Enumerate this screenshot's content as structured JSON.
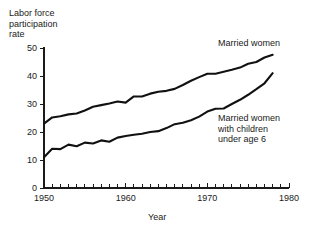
{
  "chart_data": {
    "type": "line",
    "title": "",
    "ylabel": "Labor force\nparticipation\nrate",
    "xlabel": "Year",
    "xlim": [
      1950,
      1980
    ],
    "ylim": [
      0,
      50
    ],
    "ytick_labels": [
      "0",
      "10",
      "20",
      "30",
      "40",
      "50"
    ],
    "ytick_values": [
      0,
      10,
      20,
      30,
      40,
      50
    ],
    "xtick_labels": [
      "1950",
      "1960",
      "1970",
      "1980"
    ],
    "xtick_values": [
      1950,
      1960,
      1970,
      1980
    ],
    "xtick_minor_step": 1,
    "grid": false,
    "legend_position": "inline-annotations",
    "line_color": "#111111",
    "series": [
      {
        "name": "Married women",
        "annotation": "Married women",
        "x": [
          1950,
          1951,
          1952,
          1953,
          1954,
          1955,
          1956,
          1957,
          1958,
          1959,
          1960,
          1961,
          1962,
          1963,
          1964,
          1965,
          1966,
          1967,
          1968,
          1969,
          1970,
          1971,
          1972,
          1973,
          1974,
          1975,
          1976,
          1977,
          1978
        ],
        "values": [
          23.0,
          25.2,
          25.6,
          26.3,
          26.6,
          27.7,
          29.0,
          29.6,
          30.2,
          30.9,
          30.5,
          32.7,
          32.7,
          33.7,
          34.4,
          34.7,
          35.4,
          36.8,
          38.3,
          39.6,
          40.8,
          40.8,
          41.5,
          42.2,
          43.0,
          44.4,
          45.0,
          46.6,
          47.6
        ]
      },
      {
        "name": "Married women with children under age 6",
        "annotation": "Married women\nwith children\nunder age 6",
        "x": [
          1950,
          1951,
          1952,
          1953,
          1954,
          1955,
          1956,
          1957,
          1958,
          1959,
          1960,
          1961,
          1962,
          1963,
          1964,
          1965,
          1966,
          1967,
          1968,
          1969,
          1970,
          1971,
          1972,
          1973,
          1974,
          1975,
          1976,
          1977,
          1978
        ],
        "values": [
          11.0,
          14.0,
          13.9,
          15.5,
          14.9,
          16.2,
          15.9,
          17.0,
          16.5,
          18.0,
          18.6,
          19.0,
          19.4,
          20.0,
          20.3,
          21.4,
          22.8,
          23.3,
          24.2,
          25.5,
          27.3,
          28.3,
          28.4,
          30.0,
          31.5,
          33.3,
          35.3,
          37.4,
          41.0
        ]
      }
    ]
  }
}
